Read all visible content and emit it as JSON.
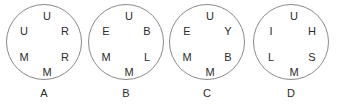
{
  "figure": {
    "background_color": "#ffffff",
    "outline_color": "#8a8a8a",
    "text_color": "#2b2b2b",
    "groups": [
      {
        "label": "A",
        "letters": {
          "top": "U",
          "upper_left": "U",
          "upper_right": "R",
          "lower_left": "M",
          "lower_right": "R",
          "bottom": "M"
        }
      },
      {
        "label": "B",
        "letters": {
          "top": "U",
          "upper_left": "E",
          "upper_right": "B",
          "lower_left": "M",
          "lower_right": "L",
          "bottom": "M"
        }
      },
      {
        "label": "C",
        "letters": {
          "top": "U",
          "upper_left": "E",
          "upper_right": "Y",
          "lower_left": "M",
          "lower_right": "B",
          "bottom": "M"
        }
      },
      {
        "label": "D",
        "letters": {
          "top": "U",
          "upper_left": "I",
          "upper_right": "H",
          "lower_left": "L",
          "lower_right": "S",
          "bottom": "M"
        }
      }
    ]
  }
}
